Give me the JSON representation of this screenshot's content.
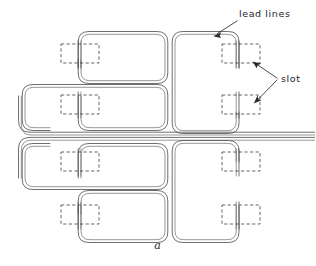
{
  "figure": {
    "caption": "a",
    "background_color": "#ffffff",
    "line_color": "#555558",
    "slot_color": "#3c3c40",
    "label_color": "#242428",
    "width": 315,
    "height": 266
  },
  "labels": [
    {
      "id": "lead-lines",
      "text": "lead lines",
      "x": 239,
      "y": 9,
      "arrow_from": [
        236,
        22
      ],
      "arrow_to": [
        213,
        36
      ]
    },
    {
      "id": "slot",
      "text": "slot",
      "x": 281,
      "y": 74,
      "arrow_from": [
        277,
        77
      ],
      "arrow_to": [
        252,
        62
      ]
    }
  ],
  "annotations": {
    "lead_lines_label": "lead lines",
    "slot_label": "slot",
    "slot_arrow_count": 2
  },
  "slots": [
    {
      "id": "slot-tl-1",
      "x": 61,
      "y": 44,
      "w": 38,
      "h": 19
    },
    {
      "id": "slot-tr-1",
      "x": 222,
      "y": 44,
      "w": 38,
      "h": 19
    },
    {
      "id": "slot-tl-2",
      "x": 61,
      "y": 95,
      "w": 38,
      "h": 19
    },
    {
      "id": "slot-tr-2",
      "x": 222,
      "y": 95,
      "w": 38,
      "h": 19
    },
    {
      "id": "slot-bl-1",
      "x": 61,
      "y": 152,
      "w": 38,
      "h": 19
    },
    {
      "id": "slot-br-1",
      "x": 222,
      "y": 152,
      "w": 38,
      "h": 19
    },
    {
      "id": "slot-bl-2",
      "x": 61,
      "y": 205,
      "w": 38,
      "h": 19
    },
    {
      "id": "slot-br-2",
      "x": 222,
      "y": 205,
      "w": 38,
      "h": 19
    }
  ],
  "coils": [
    {
      "id": "coil-top-left",
      "x": 73,
      "y": 31,
      "w": 95,
      "h": 52,
      "corner": 11
    },
    {
      "id": "coil-top-right",
      "x": 172,
      "y": 31,
      "w": 75,
      "h": 103,
      "corner": 11
    },
    {
      "id": "coil-mid-upper",
      "x": 22,
      "y": 84,
      "w": 146,
      "h": 50,
      "corner": 11
    },
    {
      "id": "coil-mid-lower",
      "x": 22,
      "y": 140,
      "w": 146,
      "h": 50,
      "corner": 11
    },
    {
      "id": "coil-bottom-left",
      "x": 73,
      "y": 192,
      "w": 95,
      "h": 52,
      "corner": 11
    },
    {
      "id": "coil-bottom-right",
      "x": 172,
      "y": 140,
      "w": 75,
      "h": 104,
      "corner": 11
    }
  ],
  "lead_lines": {
    "count": 2,
    "exit_edge": "right",
    "y_positions": [
      133,
      137
    ],
    "x_start": 18,
    "x_end": 315
  }
}
